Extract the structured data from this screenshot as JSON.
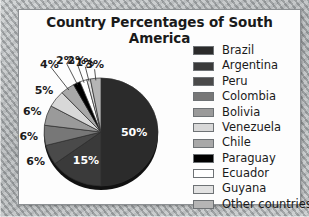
{
  "background": {
    "name": "map-texture",
    "color": "#b9bcbd"
  },
  "panel": {
    "border_color": "#8c9093",
    "fill_color": "#fdfdfd"
  },
  "title": "Country Percentages of South America",
  "chart_data": {
    "type": "pie",
    "title": "Country Percentages of South America",
    "xlabel": "",
    "ylabel": "",
    "legend_position": "right",
    "grid": false,
    "start_angle_deg": 0,
    "direction": "clockwise",
    "categories": [
      "Brazil",
      "Argentina",
      "Peru",
      "Colombia",
      "Bolivia",
      "Venezuela",
      "Chile",
      "Paraguay",
      "Ecuador",
      "Guyana",
      "Other countries"
    ],
    "values": [
      50,
      15,
      6,
      6,
      6,
      5,
      4,
      2,
      2,
      1,
      3
    ],
    "value_labels": [
      "50%",
      "15%",
      "6%",
      "6%",
      "6%",
      "5%",
      "4%",
      "2%",
      "2%",
      "1%",
      "3%"
    ],
    "colors": [
      "#2b2b2b",
      "#3a3a3a",
      "#4a4a4a",
      "#777777",
      "#9a9a9a",
      "#d8d8d8",
      "#a8a8a8",
      "#000000",
      "#ffffff",
      "#e2e2e2",
      "#b5b5b5"
    ],
    "label_placement": [
      "inside",
      "inside",
      "outside",
      "outside",
      "outside",
      "outside",
      "outside",
      "outside",
      "outside",
      "outside",
      "outside"
    ]
  },
  "legend": {
    "items": [
      {
        "label": "Brazil",
        "color": "#2b2b2b"
      },
      {
        "label": "Argentina",
        "color": "#3a3a3a"
      },
      {
        "label": "Peru",
        "color": "#4a4a4a"
      },
      {
        "label": "Colombia",
        "color": "#777777"
      },
      {
        "label": "Bolivia",
        "color": "#9a9a9a"
      },
      {
        "label": "Venezuela",
        "color": "#d8d8d8"
      },
      {
        "label": "Chile",
        "color": "#a8a8a8"
      },
      {
        "label": "Paraguay",
        "color": "#000000"
      },
      {
        "label": "Ecuador",
        "color": "#ffffff"
      },
      {
        "label": "Guyana",
        "color": "#e2e2e2"
      },
      {
        "label": "Other countries",
        "color": "#b5b5b5"
      }
    ]
  }
}
